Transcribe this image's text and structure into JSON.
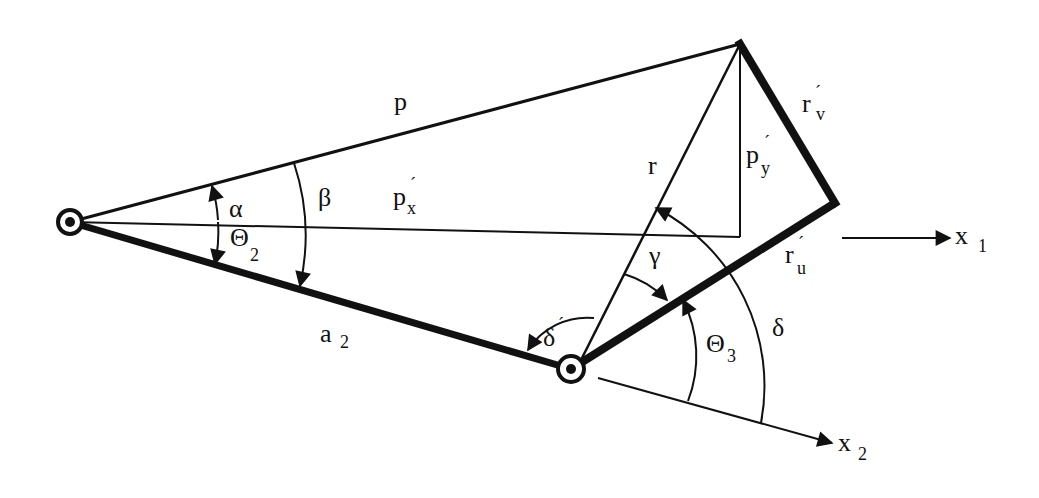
{
  "diagram": {
    "colors": {
      "ink": "#111111",
      "background": "#ffffff"
    },
    "joints": [
      {
        "id": "base-joint",
        "x": 70,
        "y": 222
      },
      {
        "id": "elbow-joint",
        "x": 571,
        "y": 369
      }
    ],
    "points": {
      "tip": {
        "x": 740,
        "y": 44
      },
      "corner": {
        "x": 835,
        "y": 203
      },
      "foot": {
        "x": 740,
        "y": 237
      }
    },
    "labels": {
      "p": {
        "main": "p",
        "sub": ""
      },
      "px": {
        "main": "p",
        "prime": "´",
        "sub": "x"
      },
      "py": {
        "main": "p",
        "prime": "´",
        "sub": "y"
      },
      "r": {
        "main": "r",
        "sub": ""
      },
      "rv": {
        "main": "r",
        "prime": "´",
        "sub": "v"
      },
      "ru": {
        "main": "r",
        "prime": "´",
        "sub": "u"
      },
      "alpha": {
        "main": "α"
      },
      "beta": {
        "main": "β"
      },
      "gamma": {
        "main": "γ"
      },
      "delta": {
        "main": "δ"
      },
      "delta_prime": {
        "main": "δ",
        "prime": "´"
      },
      "theta2": {
        "main": "Θ",
        "sub": "2"
      },
      "theta3": {
        "main": "Θ",
        "sub": "3"
      },
      "a2": {
        "main": "a",
        "sub": "2"
      },
      "x1": {
        "main": "x",
        "sub": "1"
      },
      "x2": {
        "main": "x",
        "sub": "2"
      }
    }
  }
}
